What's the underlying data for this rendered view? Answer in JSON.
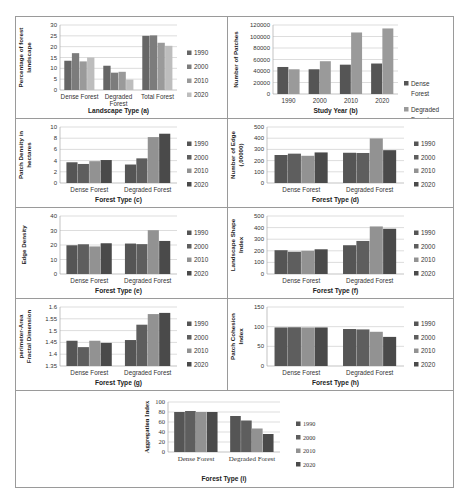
{
  "chart_data": [
    {
      "id": "a",
      "type": "bar",
      "title": "",
      "xlabel": "Landscape Type (a)",
      "ylabel": "Percentage of forest landscape",
      "categories": [
        "Dense Forest",
        "Degraded Forest",
        "Total Forest"
      ],
      "series": [
        {
          "name": "1990",
          "values": [
            13.5,
            11.2,
            25.0
          ],
          "color": "#666666"
        },
        {
          "name": "2000",
          "values": [
            17.0,
            8.0,
            25.2
          ],
          "color": "#7c7c7c"
        },
        {
          "name": "2010",
          "values": [
            13.2,
            8.4,
            21.8
          ],
          "color": "#9a9a9a"
        },
        {
          "name": "2020",
          "values": [
            15.0,
            4.8,
            20.4
          ],
          "color": "#bdbdbd"
        }
      ],
      "ylim": [
        0,
        30
      ],
      "yticks": [
        0,
        5,
        10,
        15,
        20,
        25,
        30
      ],
      "grid": true,
      "legend_position": "right"
    },
    {
      "id": "b",
      "type": "bar",
      "title": "",
      "xlabel": "Study Year (b)",
      "ylabel": "Number of Patches",
      "categories": [
        "1990",
        "2000",
        "2010",
        "2020"
      ],
      "series": [
        {
          "name": "Dense Forest",
          "values": [
            47000,
            43000,
            51000,
            53000
          ],
          "color": "#555555"
        },
        {
          "name": "Degraded Forest",
          "values": [
            43000,
            57000,
            107000,
            114000
          ],
          "color": "#9a9a9a"
        }
      ],
      "ylim": [
        0,
        120000
      ],
      "yticks": [
        0,
        20000,
        40000,
        60000,
        80000,
        100000,
        120000
      ],
      "grid": true,
      "legend_position": "right"
    },
    {
      "id": "c",
      "type": "bar",
      "xlabel": "Forest Type (c)",
      "ylabel": "Patch Density in hectares",
      "categories": [
        "Dense Forest",
        "Degraded Forest"
      ],
      "series": [
        {
          "name": "1990",
          "values": [
            3.7,
            3.3
          ],
          "color": "#555555"
        },
        {
          "name": "2000",
          "values": [
            3.4,
            4.4
          ],
          "color": "#5e5e5e"
        },
        {
          "name": "2010",
          "values": [
            3.9,
            8.2
          ],
          "color": "#929292"
        },
        {
          "name": "2020",
          "values": [
            4.1,
            8.8
          ],
          "color": "#4a4a4a"
        }
      ],
      "ylim": [
        0,
        10
      ],
      "yticks": [
        0,
        2,
        4,
        6,
        8,
        10
      ],
      "grid": true,
      "legend_position": "right"
    },
    {
      "id": "d",
      "type": "bar",
      "xlabel": "Forest Type (d)",
      "ylabel": "Number of Edge (,00000)",
      "categories": [
        "Dense Forest",
        "Degraded Forest"
      ],
      "series": [
        {
          "name": "1990",
          "values": [
            250,
            270
          ],
          "color": "#555555"
        },
        {
          "name": "2000",
          "values": [
            262,
            268
          ],
          "color": "#5e5e5e"
        },
        {
          "name": "2010",
          "values": [
            243,
            398
          ],
          "color": "#929292"
        },
        {
          "name": "2020",
          "values": [
            273,
            293
          ],
          "color": "#4a4a4a"
        }
      ],
      "ylim": [
        0,
        500
      ],
      "yticks": [
        0,
        100,
        200,
        300,
        400,
        500
      ],
      "grid": true,
      "legend_position": "right"
    },
    {
      "id": "e",
      "type": "bar",
      "xlabel": "Forest Type (e)",
      "ylabel": "Edge Density",
      "categories": [
        "Dense Forest",
        "Degraded Forest"
      ],
      "series": [
        {
          "name": "1990",
          "values": [
            19.8,
            21.0
          ],
          "color": "#555555"
        },
        {
          "name": "2000",
          "values": [
            20.5,
            20.6
          ],
          "color": "#5e5e5e"
        },
        {
          "name": "2010",
          "values": [
            19.0,
            30.2
          ],
          "color": "#929292"
        },
        {
          "name": "2020",
          "values": [
            21.2,
            22.8
          ],
          "color": "#4a4a4a"
        }
      ],
      "ylim": [
        0,
        40
      ],
      "yticks": [
        0,
        10,
        20,
        30,
        40
      ],
      "grid": true,
      "legend_position": "right"
    },
    {
      "id": "f",
      "type": "bar",
      "xlabel": "Forest Type (f)",
      "ylabel": "Landscape Shape Index",
      "categories": [
        "Dense Forest",
        "Degraded Forest"
      ],
      "series": [
        {
          "name": "1990",
          "values": [
            205,
            248
          ],
          "color": "#555555"
        },
        {
          "name": "2000",
          "values": [
            192,
            285
          ],
          "color": "#5e5e5e"
        },
        {
          "name": "2010",
          "values": [
            200,
            410
          ],
          "color": "#929292"
        },
        {
          "name": "2020",
          "values": [
            213,
            390
          ],
          "color": "#4a4a4a"
        }
      ],
      "ylim": [
        0,
        500
      ],
      "yticks": [
        0,
        100,
        200,
        300,
        400,
        500
      ],
      "grid": true,
      "legend_position": "right"
    },
    {
      "id": "g",
      "type": "bar",
      "xlabel": "Forest Type (g)",
      "ylabel": "perimeter-Area Fractal Dimension",
      "categories": [
        "Dense Forest",
        "Degraded Forest"
      ],
      "series": [
        {
          "name": "1990",
          "values": [
            1.457,
            1.46
          ],
          "color": "#555555"
        },
        {
          "name": "2000",
          "values": [
            1.43,
            1.525
          ],
          "color": "#5e5e5e"
        },
        {
          "name": "2010",
          "values": [
            1.457,
            1.57
          ],
          "color": "#929292"
        },
        {
          "name": "2020",
          "values": [
            1.448,
            1.575
          ],
          "color": "#4a4a4a"
        }
      ],
      "ylim": [
        1.35,
        1.6
      ],
      "yticks": [
        1.35,
        1.4,
        1.45,
        1.5,
        1.55,
        1.6
      ],
      "ytick_labels": [
        "1.35",
        "1.4",
        "1.45",
        "1.5",
        "1.55",
        "1.6"
      ],
      "grid": true,
      "legend_position": "right"
    },
    {
      "id": "h",
      "type": "bar",
      "xlabel": "Forest Type (h)",
      "ylabel": "Patch Cohesion Index",
      "categories": [
        "Dense Forest",
        "Degraded Forest"
      ],
      "series": [
        {
          "name": "1990",
          "values": [
            98,
            94
          ],
          "color": "#555555"
        },
        {
          "name": "2000",
          "values": [
            98.5,
            93
          ],
          "color": "#5e5e5e"
        },
        {
          "name": "2010",
          "values": [
            98,
            87
          ],
          "color": "#929292"
        },
        {
          "name": "2020",
          "values": [
            98,
            74
          ],
          "color": "#4a4a4a"
        }
      ],
      "ylim": [
        0,
        150
      ],
      "yticks": [
        0,
        50,
        100,
        150
      ],
      "grid": true,
      "legend_position": "right"
    },
    {
      "id": "i",
      "type": "bar",
      "xlabel": "Forest Type (i)",
      "ylabel": "Aggregation Index",
      "categories": [
        "Dense Forest",
        "Degraded Forest"
      ],
      "series": [
        {
          "name": "1990",
          "values": [
            80,
            72
          ],
          "color": "#555555"
        },
        {
          "name": "2000",
          "values": [
            82,
            63
          ],
          "color": "#5e5e5e"
        },
        {
          "name": "2010",
          "values": [
            80,
            47
          ],
          "color": "#929292"
        },
        {
          "name": "2020",
          "values": [
            80,
            36
          ],
          "color": "#4a4a4a"
        }
      ],
      "ylim": [
        0,
        100
      ],
      "yticks": [
        0,
        20,
        40,
        60,
        80,
        100
      ],
      "grid": true,
      "legend_position": "right"
    }
  ],
  "layout": {
    "panels": [
      {
        "id": "a",
        "x": 15,
        "y": 16,
        "w": 212,
        "h": 102,
        "serif": false,
        "ylabel_lines": [
          "Percentage of forest",
          "landscape"
        ],
        "xlabel_lines": [
          "Landscape Type (a)"
        ],
        "cat_lines": [
          [
            "Dense Forest"
          ],
          [
            "Degraded",
            "Forest"
          ],
          [
            "Total Forest"
          ]
        ]
      },
      {
        "id": "b",
        "x": 227,
        "y": 16,
        "w": 227,
        "h": 102,
        "serif": false,
        "ylabel_lines": [
          "Number of Patches"
        ],
        "xlabel_lines": [
          "Study Year (b)"
        ]
      },
      {
        "id": "c",
        "x": 15,
        "y": 118,
        "w": 212,
        "h": 89,
        "serif": false,
        "ylabel_lines": [
          "Patch Density in",
          "hectares"
        ],
        "xlabel_lines": [
          "Forest Type (c)"
        ]
      },
      {
        "id": "d",
        "x": 227,
        "y": 118,
        "w": 227,
        "h": 89,
        "serif": false,
        "ylabel_lines": [
          "Number of Edge",
          "(,00000)"
        ],
        "xlabel_lines": [
          "Forest Type (d)"
        ]
      },
      {
        "id": "e",
        "x": 15,
        "y": 207,
        "w": 212,
        "h": 91,
        "serif": false,
        "ylabel_lines": [
          "Edge Density"
        ],
        "xlabel_lines": [
          "Forest Type (e)"
        ]
      },
      {
        "id": "f",
        "x": 227,
        "y": 207,
        "w": 227,
        "h": 91,
        "serif": false,
        "ylabel_lines": [
          "Landscape Shape",
          "Index"
        ],
        "xlabel_lines": [
          "Forest Type (f)"
        ]
      },
      {
        "id": "g",
        "x": 15,
        "y": 298,
        "w": 212,
        "h": 92,
        "serif": false,
        "ylabel_lines": [
          "perimeter-Area",
          "Fractal Dimension"
        ],
        "xlabel_lines": [
          "Forest Type (g)"
        ]
      },
      {
        "id": "h",
        "x": 227,
        "y": 298,
        "w": 227,
        "h": 92,
        "serif": false,
        "ylabel_lines": [
          "Patch Cohesion",
          "Index"
        ],
        "xlabel_lines": [
          "Forest Type (h)"
        ]
      },
      {
        "id": "i",
        "x": 110,
        "y": 390,
        "w": 250,
        "h": 98,
        "serif": true,
        "ylabel_lines": [
          "Aggregation Index"
        ],
        "xlabel_lines": [
          "Forest Type (i)"
        ]
      }
    ]
  }
}
